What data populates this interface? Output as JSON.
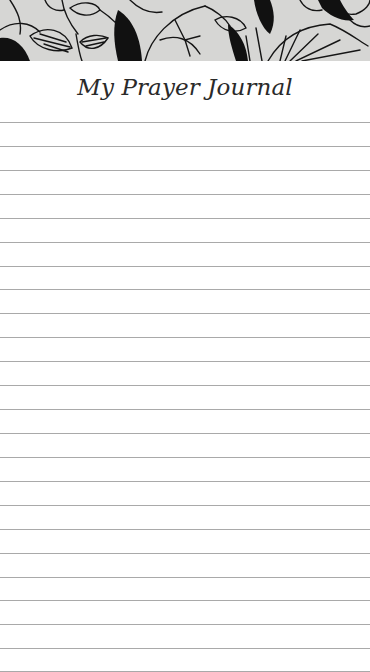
{
  "page": {
    "title": "My Prayer Journal",
    "background_color": "#ffffff"
  },
  "banner": {
    "description": "Black line-art floral and leaf illustration on light gray band",
    "background_color": "#d6d6d4",
    "ink_color": "#111111"
  },
  "ruled_lines": {
    "count": 24,
    "first_y": 122,
    "spacing": 23.9,
    "color": "#a9a9a9"
  }
}
